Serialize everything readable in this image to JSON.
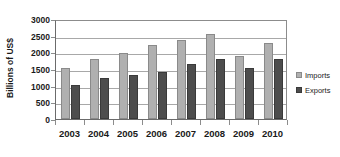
{
  "chart_data": {
    "type": "bar",
    "title": "",
    "subtitle": "",
    "xlabel": "",
    "ylabel": "Billions of US$",
    "categories": [
      "2003",
      "2004",
      "2005",
      "2006",
      "2007",
      "2008",
      "2009",
      "2010"
    ],
    "series": [
      {
        "name": "Imports",
        "color": "#b0b0b0",
        "values": [
          1520,
          1790,
          1980,
          2220,
          2370,
          2540,
          1880,
          2270
        ]
      },
      {
        "name": "Exports",
        "color": "#4d4d4d",
        "values": [
          1030,
          1220,
          1320,
          1420,
          1650,
          1810,
          1530,
          1800
        ]
      }
    ],
    "ylim": [
      0,
      3000
    ],
    "ytick_values": [
      0,
      500,
      1000,
      1500,
      2000,
      2500,
      3000
    ],
    "ytick_labels": [
      "0",
      "500",
      "1000",
      "1500",
      "2000",
      "2500",
      "3000"
    ],
    "grid": true,
    "grid_axis": "y",
    "legend": [
      "Imports",
      "Exports"
    ],
    "legend_position": "right"
  }
}
